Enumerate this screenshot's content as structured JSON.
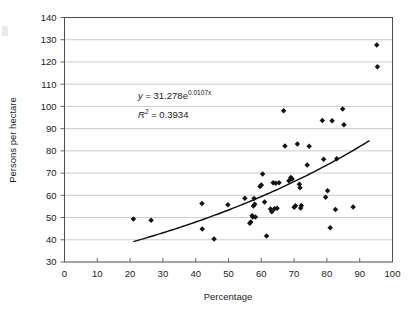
{
  "chart_data": {
    "type": "scatter",
    "title": "",
    "xlabel": "Percentage",
    "ylabel": "Persons per hectare",
    "xlim": [
      0,
      100
    ],
    "ylim": [
      30,
      140
    ],
    "xticks": [
      0,
      10,
      20,
      30,
      40,
      50,
      60,
      70,
      80,
      90,
      100
    ],
    "yticks": [
      30,
      40,
      50,
      60,
      70,
      80,
      90,
      100,
      110,
      120,
      130,
      140
    ],
    "xtick_labels": [
      "0",
      "10",
      "20",
      "30",
      "40",
      "50",
      "60",
      "70",
      "80",
      "90",
      "100"
    ],
    "ytick_labels": [
      "30",
      "40",
      "50",
      "60",
      "70",
      "80",
      "90",
      "100",
      "110",
      "120",
      "130",
      "140"
    ],
    "grid": "horizontal",
    "legend": "none",
    "marker_shape": "diamond",
    "marker_color": "#141414",
    "points": [
      {
        "x": 21.0,
        "y": 49.3
      },
      {
        "x": 26.4,
        "y": 48.8
      },
      {
        "x": 41.9,
        "y": 56.3
      },
      {
        "x": 42.0,
        "y": 44.8
      },
      {
        "x": 45.6,
        "y": 40.4
      },
      {
        "x": 49.8,
        "y": 55.8
      },
      {
        "x": 55.0,
        "y": 58.7
      },
      {
        "x": 56.5,
        "y": 47.4
      },
      {
        "x": 56.8,
        "y": 48.0
      },
      {
        "x": 57.2,
        "y": 50.8
      },
      {
        "x": 57.4,
        "y": 50.3
      },
      {
        "x": 57.6,
        "y": 55.2
      },
      {
        "x": 57.8,
        "y": 58.6
      },
      {
        "x": 58.0,
        "y": 56.0
      },
      {
        "x": 58.2,
        "y": 50.2
      },
      {
        "x": 59.6,
        "y": 64.0
      },
      {
        "x": 60.0,
        "y": 64.6
      },
      {
        "x": 60.4,
        "y": 69.6
      },
      {
        "x": 61.0,
        "y": 57.0
      },
      {
        "x": 61.6,
        "y": 41.7
      },
      {
        "x": 62.8,
        "y": 53.9
      },
      {
        "x": 63.2,
        "y": 52.6
      },
      {
        "x": 63.6,
        "y": 65.6
      },
      {
        "x": 64.0,
        "y": 54.0
      },
      {
        "x": 64.4,
        "y": 65.4
      },
      {
        "x": 64.8,
        "y": 54.2
      },
      {
        "x": 65.4,
        "y": 65.7
      },
      {
        "x": 66.8,
        "y": 98.1
      },
      {
        "x": 67.2,
        "y": 82.2
      },
      {
        "x": 68.4,
        "y": 66.6
      },
      {
        "x": 69.0,
        "y": 68.0
      },
      {
        "x": 69.4,
        "y": 67.3
      },
      {
        "x": 70.0,
        "y": 54.6
      },
      {
        "x": 70.4,
        "y": 55.3
      },
      {
        "x": 71.0,
        "y": 83.1
      },
      {
        "x": 71.6,
        "y": 65.0
      },
      {
        "x": 71.8,
        "y": 63.4
      },
      {
        "x": 72.0,
        "y": 54.3
      },
      {
        "x": 72.2,
        "y": 55.4
      },
      {
        "x": 74.0,
        "y": 73.6
      },
      {
        "x": 74.6,
        "y": 82.1
      },
      {
        "x": 78.6,
        "y": 93.7
      },
      {
        "x": 79.0,
        "y": 76.2
      },
      {
        "x": 79.6,
        "y": 59.1
      },
      {
        "x": 80.2,
        "y": 62.0
      },
      {
        "x": 81.0,
        "y": 45.4
      },
      {
        "x": 81.6,
        "y": 93.6
      },
      {
        "x": 82.6,
        "y": 53.6
      },
      {
        "x": 83.0,
        "y": 76.5
      },
      {
        "x": 84.8,
        "y": 98.8
      },
      {
        "x": 85.2,
        "y": 91.7
      },
      {
        "x": 88.0,
        "y": 54.8
      },
      {
        "x": 95.2,
        "y": 127.6
      },
      {
        "x": 95.4,
        "y": 117.8
      }
    ],
    "trendline": {
      "type": "exponential",
      "coefficient": 31.278,
      "exponent": 0.0107,
      "r_squared": 0.3934,
      "x_start": 21,
      "x_end": 93
    },
    "annotations": {
      "equation_prefix_y": "y",
      "equation_body": " = 31.278e",
      "equation_exponent": "0.0107x",
      "r2_label": "R",
      "r2_sup": "2",
      "r2_value": " = 0.3934"
    }
  }
}
